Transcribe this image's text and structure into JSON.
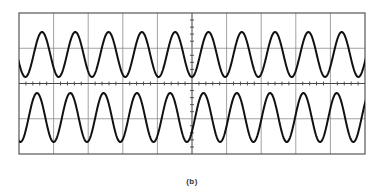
{
  "figure": {
    "caption": "(b)",
    "background": "#ffffff"
  },
  "graticule": {
    "left": 19,
    "right": 365,
    "top": 13,
    "bottom": 154,
    "h_divisions": 10,
    "v_divisions": 4,
    "border_color": "#555555",
    "grid_color": "#8a8a8a",
    "axis_color": "#444444",
    "minor_ticks_per_division": 5,
    "tick_length": 4
  },
  "traces": [
    {
      "name": "upper-channel",
      "center_y": 54.5,
      "amplitude": 22.5,
      "period": 33.3,
      "first_peak_x": 42,
      "color": "#111111",
      "stroke_width": 2
    },
    {
      "name": "lower-channel",
      "center_y": 117.5,
      "amplitude": 24.5,
      "period": 33.3,
      "first_peak_x": 37,
      "color": "#111111",
      "stroke_width": 2
    }
  ]
}
